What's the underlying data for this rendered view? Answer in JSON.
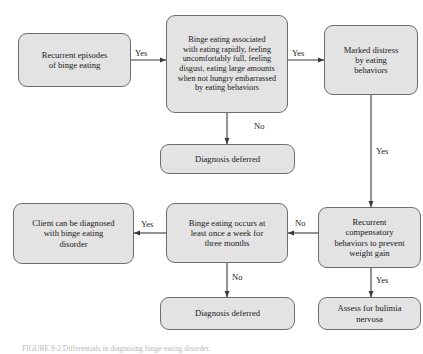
{
  "figure": {
    "caption": "FIGURE 8-2   Differentials in diagnosing binge-eating disorder."
  },
  "nodes": {
    "recurrent_episodes": {
      "label": "Recurrent episodes\nof binge eating",
      "font_size": 8.6
    },
    "binge_criteria": {
      "label": "Binge eating associated\nwith eating rapidly, feeling\nuncomfortably full, feeling\ndisgust, eating large amounts\nwhen not hungry embarrassed\nby eating behaviors",
      "font_size": 8.2
    },
    "marked_distress": {
      "label": "Marked distress\nby eating\nbehaviors",
      "font_size": 8.6
    },
    "diagnosis_deferred_top": {
      "label": "Diagnosis deferred",
      "font_size": 8.6
    },
    "client_diagnosed": {
      "label": "Client can be diagnosed\nwith binge eating\ndisorder",
      "font_size": 8.6
    },
    "frequency_criteria": {
      "label": "Binge eating occurs at\nleast once a week for\nthree months",
      "font_size": 8.6
    },
    "compensatory_behaviors": {
      "label": "Recurrent\ncompensatory\nbehaviors to prevent\nweight gain",
      "font_size": 8.6
    },
    "diagnosis_deferred_bottom": {
      "label": "Diagnosis deferred",
      "font_size": 8.6
    },
    "assess_bulimia": {
      "label": "Assess for bulimia\nnervosa",
      "font_size": 8.6
    }
  },
  "edges": {
    "episodes_to_criteria": "Yes",
    "criteria_to_distress": "Yes",
    "criteria_to_deferred": "No",
    "distress_to_compensatory": "Yes",
    "compensatory_to_frequency": "No",
    "compensatory_to_bulimia": "Yes",
    "frequency_to_client": "Yes",
    "frequency_to_deferred": "No"
  },
  "colors": {
    "node_fill": "#e3e3e3",
    "node_border": "#6e6e6e",
    "line": "#3a3a3a",
    "text": "#1a1a1a"
  }
}
